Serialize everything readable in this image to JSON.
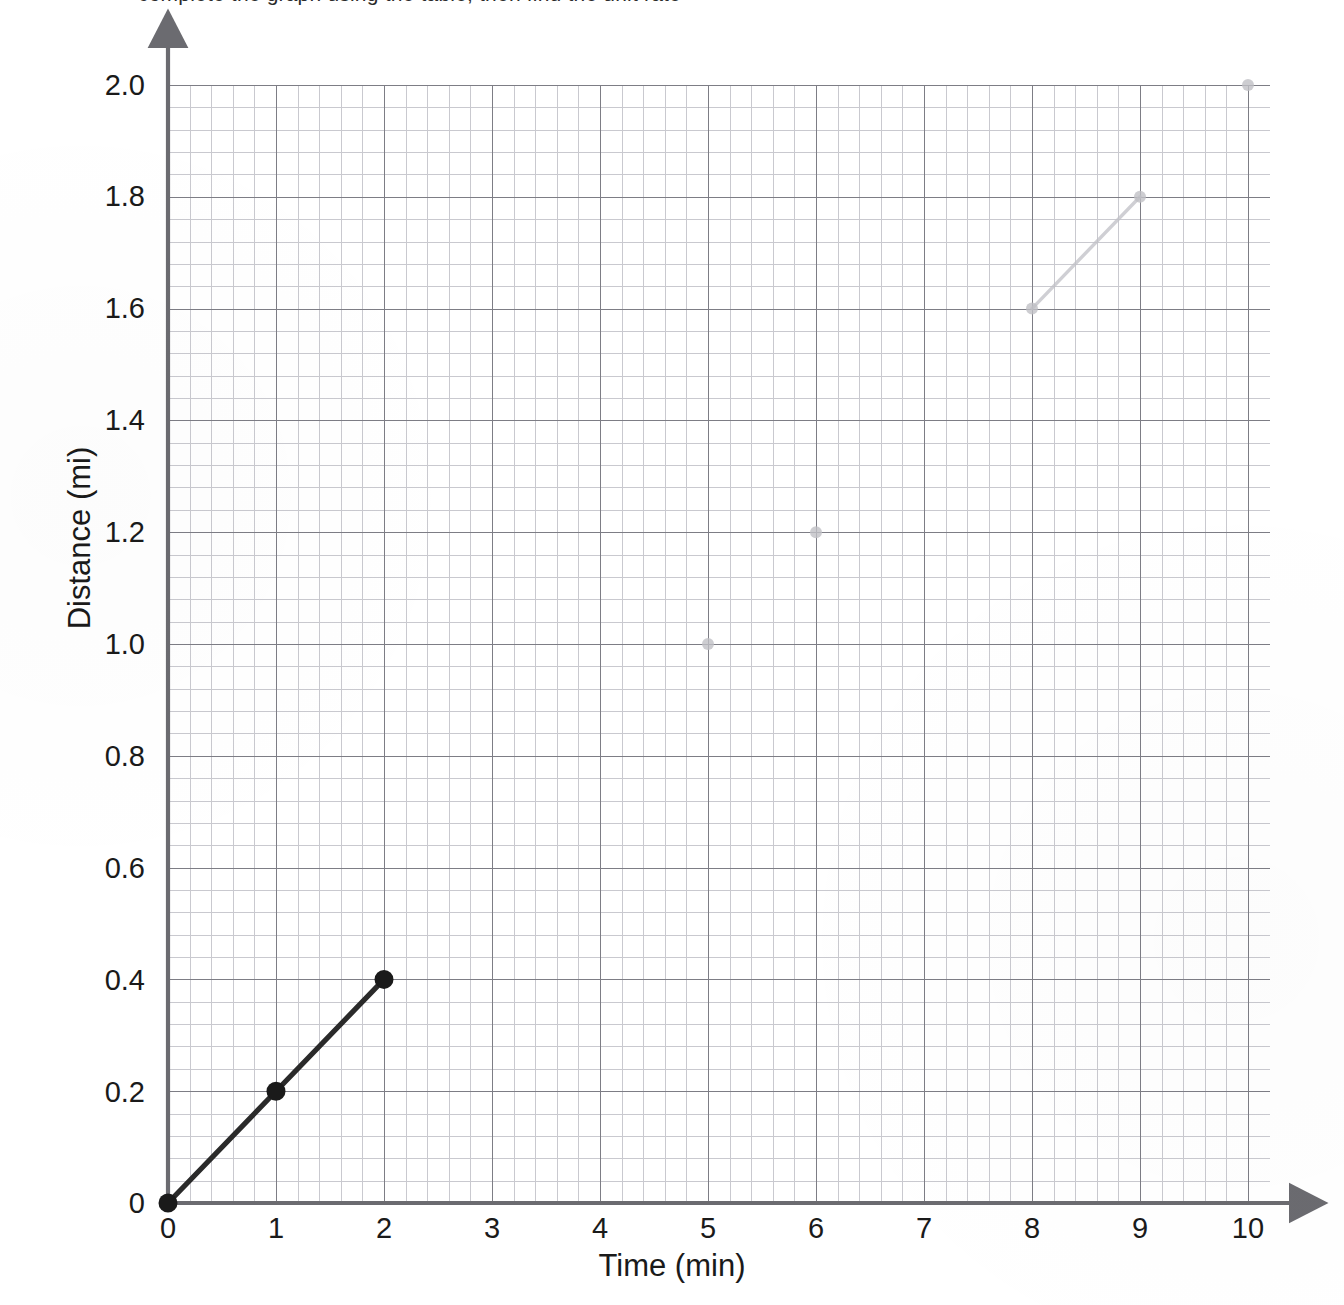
{
  "header": {
    "clipped_text": "complete the graph using the table, then find the unit rate"
  },
  "axes": {
    "x_title": "Time (min)",
    "y_title": "Distance (mi)",
    "x_ticks": [
      "0",
      "1",
      "2",
      "3",
      "4",
      "5",
      "6",
      "7",
      "8",
      "9",
      "10"
    ],
    "y_ticks": [
      "0",
      "0.2",
      "0.4",
      "0.6",
      "0.8",
      "1.0",
      "1.2",
      "1.4",
      "1.6",
      "1.8",
      "2.0"
    ]
  },
  "colors": {
    "minor_grid": "#c9c9cf",
    "major_grid": "#7d7d85",
    "axis": "#6b6b70",
    "plot_line": "#2a2a2a",
    "point_fill": "#1a1a1a",
    "erased_mark": "#c0c0c6"
  },
  "chart_data": {
    "type": "line",
    "title": "",
    "xlabel": "Time (min)",
    "ylabel": "Distance (mi)",
    "xlim": [
      0,
      10
    ],
    "ylim": [
      0,
      2.0
    ],
    "xtick_step": 1,
    "ytick_step": 0.2,
    "x_minor_per_major": 5,
    "y_minor_per_major": 5,
    "grid": true,
    "legend": "none",
    "series": [
      {
        "name": "Distance traveled",
        "x": [
          0,
          1,
          2
        ],
        "y": [
          0,
          0.2,
          0.4
        ],
        "markers": "filled-circle",
        "line_style": "solid",
        "unit_rate": "0.2 mi per min"
      }
    ],
    "annotations": [
      {
        "label": "erased-point",
        "x": 5,
        "y": 1.0
      },
      {
        "label": "erased-point",
        "x": 6,
        "y": 1.2
      },
      {
        "label": "erased-point",
        "x": 8,
        "y": 1.6
      },
      {
        "label": "erased-point",
        "x": 9,
        "y": 1.8
      },
      {
        "label": "erased-point",
        "x": 10,
        "y": 2.0
      },
      {
        "label": "erased-segment",
        "x": 8,
        "y": 1.6,
        "x2": 9,
        "y2": 1.8
      }
    ]
  }
}
